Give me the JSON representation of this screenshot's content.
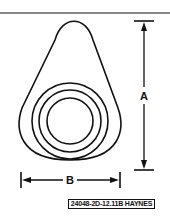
{
  "diagram": {
    "dimensions": {
      "a_label": "A",
      "b_label": "B"
    },
    "caption": "24048-2D-12.11B HAYNES",
    "colors": {
      "line": "#111111",
      "background": "#ffffff"
    }
  }
}
